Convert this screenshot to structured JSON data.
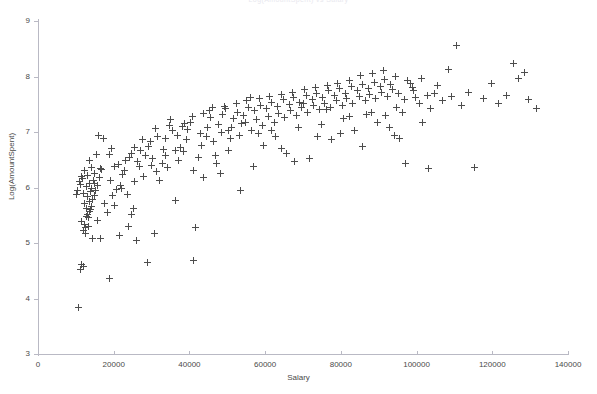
{
  "chart_data": {
    "type": "scatter",
    "title": "Log(AmountSpent) vs Salary",
    "xlabel": "Salary",
    "ylabel": "Log(AmountSpent)",
    "xlim": [
      0,
      140000
    ],
    "ylim": [
      3,
      9
    ],
    "xticks": [
      0,
      20000,
      40000,
      60000,
      80000,
      100000,
      120000,
      140000
    ],
    "yticks": [
      3,
      4,
      5,
      6,
      7,
      8,
      9
    ],
    "xtick_labels": [
      "0",
      "20000",
      "40000",
      "60000",
      "80000",
      "100000",
      "120000",
      "140000"
    ],
    "ytick_labels": [
      "3",
      "4",
      "5",
      "6",
      "7",
      "8",
      "9"
    ],
    "grid": false,
    "legend": null,
    "marker": "plus",
    "marker_color": "#4d4d4d",
    "axis_color": "#b9b9c4",
    "series": [
      {
        "name": "customers",
        "points": [
          [
            10700,
            3.83
          ],
          [
            11300,
            4.52
          ],
          [
            11500,
            4.62
          ],
          [
            12100,
            4.58
          ],
          [
            11900,
            5.22
          ],
          [
            12600,
            5.28
          ],
          [
            12200,
            5.34
          ],
          [
            13400,
            5.3
          ],
          [
            12800,
            5.47
          ],
          [
            13100,
            5.52
          ],
          [
            13700,
            5.56
          ],
          [
            12900,
            5.62
          ],
          [
            13900,
            5.6
          ],
          [
            14200,
            5.66
          ],
          [
            12400,
            5.72
          ],
          [
            13600,
            5.74
          ],
          [
            14400,
            5.78
          ],
          [
            13200,
            5.84
          ],
          [
            14800,
            5.86
          ],
          [
            12000,
            5.9
          ],
          [
            13800,
            5.92
          ],
          [
            15200,
            5.94
          ],
          [
            14100,
            5.98
          ],
          [
            12700,
            6.02
          ],
          [
            15600,
            6.04
          ],
          [
            13500,
            6.08
          ],
          [
            14600,
            6.12
          ],
          [
            11800,
            6.16
          ],
          [
            16200,
            6.18
          ],
          [
            13000,
            6.22
          ],
          [
            15000,
            6.26
          ],
          [
            12300,
            6.3
          ],
          [
            16800,
            6.32
          ],
          [
            14000,
            6.36
          ],
          [
            11200,
            6.05
          ],
          [
            10900,
            6.1
          ],
          [
            11600,
            6.2
          ],
          [
            10400,
            5.95
          ],
          [
            17500,
            5.72
          ],
          [
            18400,
            5.55
          ],
          [
            16500,
            5.08
          ],
          [
            18900,
            4.36
          ],
          [
            19600,
            5.86
          ],
          [
            20300,
            6.38
          ],
          [
            21200,
            6.42
          ],
          [
            19100,
            6.12
          ],
          [
            22400,
            6.24
          ],
          [
            20800,
            5.96
          ],
          [
            23100,
            6.48
          ],
          [
            21800,
            6.04
          ],
          [
            24300,
            6.54
          ],
          [
            22900,
            6.3
          ],
          [
            25600,
            6.1
          ],
          [
            24800,
            6.62
          ],
          [
            26300,
            6.46
          ],
          [
            23600,
            5.88
          ],
          [
            27200,
            6.66
          ],
          [
            25100,
            5.62
          ],
          [
            28400,
            6.58
          ],
          [
            26800,
            6.38
          ],
          [
            29600,
            6.82
          ],
          [
            27900,
            6.2
          ],
          [
            30800,
            5.18
          ],
          [
            29200,
            6.74
          ],
          [
            31600,
            6.92
          ],
          [
            30200,
            6.52
          ],
          [
            32800,
            6.44
          ],
          [
            31100,
            7.06
          ],
          [
            33600,
            6.88
          ],
          [
            32200,
            6.12
          ],
          [
            34800,
            7.12
          ],
          [
            33100,
            6.68
          ],
          [
            35600,
            7.02
          ],
          [
            34200,
            6.36
          ],
          [
            36800,
            6.94
          ],
          [
            35100,
            7.22
          ],
          [
            37600,
            6.72
          ],
          [
            36300,
            5.76
          ],
          [
            38800,
            7.16
          ],
          [
            37200,
            6.48
          ],
          [
            39600,
            7.04
          ],
          [
            38400,
            6.64
          ],
          [
            40800,
            7.28
          ],
          [
            39200,
            6.86
          ],
          [
            41600,
            5.28
          ],
          [
            40400,
            7.18
          ],
          [
            42800,
            6.98
          ],
          [
            41200,
            4.68
          ],
          [
            43600,
            7.34
          ],
          [
            42400,
            6.54
          ],
          [
            44800,
            7.08
          ],
          [
            43200,
            6.76
          ],
          [
            45600,
            7.26
          ],
          [
            44400,
            6.92
          ],
          [
            46800,
            6.58
          ],
          [
            45200,
            7.38
          ],
          [
            47600,
            7.14
          ],
          [
            46400,
            6.82
          ],
          [
            48800,
            7.32
          ],
          [
            47200,
            6.44
          ],
          [
            49600,
            7.42
          ],
          [
            48400,
            7.0
          ],
          [
            50800,
            6.88
          ],
          [
            49200,
            7.46
          ],
          [
            51600,
            7.24
          ],
          [
            50400,
            6.66
          ],
          [
            52800,
            7.36
          ],
          [
            51200,
            7.08
          ],
          [
            53600,
            5.94
          ],
          [
            52400,
            7.52
          ],
          [
            54800,
            7.18
          ],
          [
            53200,
            6.94
          ],
          [
            55600,
            7.44
          ],
          [
            54400,
            7.3
          ],
          [
            56800,
            6.38
          ],
          [
            55200,
            7.56
          ],
          [
            57600,
            7.22
          ],
          [
            56400,
            7.02
          ],
          [
            58800,
            7.48
          ],
          [
            57200,
            7.38
          ],
          [
            59600,
            6.76
          ],
          [
            58400,
            7.6
          ],
          [
            60800,
            7.28
          ],
          [
            59200,
            7.12
          ],
          [
            61600,
            7.54
          ],
          [
            60400,
            7.42
          ],
          [
            62800,
            6.92
          ],
          [
            61200,
            7.64
          ],
          [
            63600,
            7.34
          ],
          [
            62400,
            7.18
          ],
          [
            64800,
            7.58
          ],
          [
            63200,
            7.46
          ],
          [
            65600,
            6.62
          ],
          [
            64400,
            7.68
          ],
          [
            66800,
            7.38
          ],
          [
            65200,
            7.26
          ],
          [
            67600,
            7.62
          ],
          [
            66400,
            7.5
          ],
          [
            68800,
            7.08
          ],
          [
            67200,
            7.72
          ],
          [
            69600,
            7.44
          ],
          [
            68400,
            7.3
          ],
          [
            70800,
            7.66
          ],
          [
            69200,
            7.54
          ],
          [
            71600,
            6.52
          ],
          [
            70400,
            7.76
          ],
          [
            72800,
            7.48
          ],
          [
            71200,
            7.36
          ],
          [
            73600,
            7.7
          ],
          [
            72400,
            7.58
          ],
          [
            74800,
            7.14
          ],
          [
            73200,
            7.8
          ],
          [
            75600,
            7.52
          ],
          [
            74400,
            7.4
          ],
          [
            76800,
            7.74
          ],
          [
            75200,
            7.62
          ],
          [
            77600,
            6.86
          ],
          [
            76400,
            7.84
          ],
          [
            78800,
            7.56
          ],
          [
            77200,
            7.44
          ],
          [
            79600,
            7.78
          ],
          [
            78400,
            7.66
          ],
          [
            80800,
            7.24
          ],
          [
            79200,
            7.88
          ],
          [
            81600,
            7.6
          ],
          [
            80400,
            7.48
          ],
          [
            82800,
            7.82
          ],
          [
            81200,
            7.7
          ],
          [
            83600,
            7.02
          ],
          [
            82400,
            7.92
          ],
          [
            84800,
            7.64
          ],
          [
            83200,
            7.52
          ],
          [
            85600,
            7.86
          ],
          [
            84400,
            7.74
          ],
          [
            86800,
            7.32
          ],
          [
            85200,
            8.02
          ],
          [
            87600,
            7.68
          ],
          [
            86400,
            7.56
          ],
          [
            88800,
            7.9
          ],
          [
            87200,
            7.78
          ],
          [
            89600,
            7.18
          ],
          [
            88400,
            8.06
          ],
          [
            90800,
            7.72
          ],
          [
            89200,
            7.6
          ],
          [
            91600,
            7.94
          ],
          [
            90400,
            7.82
          ],
          [
            92800,
            7.08
          ],
          [
            91200,
            8.1
          ],
          [
            93600,
            7.76
          ],
          [
            92400,
            7.64
          ],
          [
            94800,
            7.44
          ],
          [
            93200,
            7.86
          ],
          [
            95600,
            6.88
          ],
          [
            94400,
            8.0
          ],
          [
            96800,
            7.58
          ],
          [
            95200,
            7.7
          ],
          [
            97600,
            7.92
          ],
          [
            96400,
            7.36
          ],
          [
            98800,
            7.8
          ],
          [
            97200,
            6.44
          ],
          [
            99600,
            7.62
          ],
          [
            98400,
            7.88
          ],
          [
            100800,
            7.52
          ],
          [
            99200,
            7.74
          ],
          [
            101600,
            7.18
          ],
          [
            102800,
            7.66
          ],
          [
            101200,
            7.96
          ],
          [
            103600,
            7.42
          ],
          [
            104800,
            7.7
          ],
          [
            103200,
            6.34
          ],
          [
            105600,
            7.84
          ],
          [
            106800,
            7.56
          ],
          [
            108400,
            8.12
          ],
          [
            110600,
            8.56
          ],
          [
            109200,
            7.64
          ],
          [
            111800,
            7.48
          ],
          [
            113600,
            7.72
          ],
          [
            115200,
            6.36
          ],
          [
            117600,
            7.6
          ],
          [
            119800,
            7.88
          ],
          [
            121600,
            7.52
          ],
          [
            123800,
            7.66
          ],
          [
            125600,
            8.24
          ],
          [
            126800,
            7.96
          ],
          [
            128400,
            8.08
          ],
          [
            129600,
            7.58
          ],
          [
            131800,
            7.42
          ],
          [
            17200,
            6.88
          ],
          [
            18800,
            6.6
          ],
          [
            20100,
            5.68
          ],
          [
            16100,
            6.94
          ],
          [
            19400,
            6.7
          ],
          [
            21500,
            5.14
          ],
          [
            23800,
            5.3
          ],
          [
            26100,
            5.04
          ],
          [
            28800,
            4.64
          ],
          [
            24600,
            5.52
          ],
          [
            22100,
            5.98
          ],
          [
            25400,
            6.72
          ],
          [
            27600,
            6.86
          ],
          [
            29900,
            6.4
          ],
          [
            31400,
            6.28
          ],
          [
            33800,
            6.58
          ],
          [
            36200,
            6.66
          ],
          [
            38200,
            7.1
          ],
          [
            41000,
            6.3
          ],
          [
            43800,
            6.18
          ],
          [
            46200,
            7.44
          ],
          [
            48200,
            6.26
          ],
          [
            50200,
            7.02
          ],
          [
            53800,
            7.16
          ],
          [
            56200,
            7.62
          ],
          [
            58200,
            6.98
          ],
          [
            61800,
            7.02
          ],
          [
            64200,
            6.7
          ],
          [
            67800,
            6.46
          ],
          [
            70200,
            7.52
          ],
          [
            73800,
            6.92
          ],
          [
            76200,
            7.4
          ],
          [
            79800,
            6.98
          ],
          [
            82200,
            7.28
          ],
          [
            85800,
            6.74
          ],
          [
            88200,
            7.36
          ],
          [
            91800,
            7.3
          ],
          [
            94200,
            6.94
          ],
          [
            12500,
            5.18
          ],
          [
            11400,
            5.38
          ],
          [
            13300,
            5.46
          ],
          [
            14500,
            5.08
          ],
          [
            15800,
            5.4
          ],
          [
            10200,
            5.88
          ],
          [
            14900,
            6.08
          ],
          [
            16600,
            6.34
          ],
          [
            13700,
            6.48
          ],
          [
            15400,
            6.6
          ]
        ]
      }
    ]
  },
  "axes": {
    "x_title": "Salary",
    "y_title": "Log(AmountSpent)"
  }
}
